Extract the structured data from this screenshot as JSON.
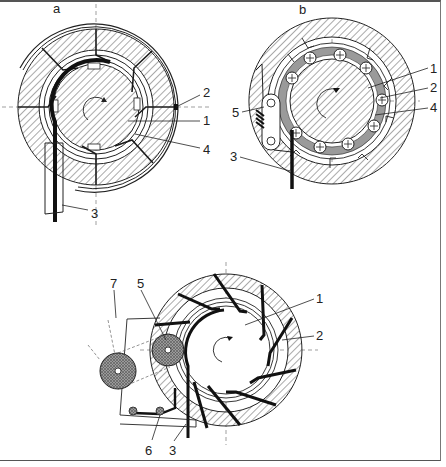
{
  "figure": {
    "type": "technical-cross-section-diagram",
    "panels": [
      {
        "id": "a",
        "label": "a",
        "callouts": [
          {
            "number": "1",
            "target": "central rotating hub"
          },
          {
            "number": "2",
            "target": "radial element in outer ring"
          },
          {
            "number": "3",
            "target": "outgoing strip / band"
          },
          {
            "number": "4",
            "target": "inner ring segment"
          }
        ]
      },
      {
        "id": "b",
        "label": "b",
        "callouts": [
          {
            "number": "1",
            "target": "central rotating hub"
          },
          {
            "number": "2",
            "target": "roller chain link"
          },
          {
            "number": "3",
            "target": "outgoing strip / band"
          },
          {
            "number": "4",
            "target": "chain pivot element"
          },
          {
            "number": "5",
            "target": "tensioning lever with spring"
          }
        ]
      },
      {
        "id": "c",
        "label": "",
        "callouts": [
          {
            "number": "1",
            "target": "central rotating disk"
          },
          {
            "number": "2",
            "target": "curved vane"
          },
          {
            "number": "3",
            "target": "outgoing strip / band"
          },
          {
            "number": "5",
            "target": "guide roller"
          },
          {
            "number": "6",
            "target": "bracket bolt"
          },
          {
            "number": "7",
            "target": "drive roller"
          }
        ]
      }
    ],
    "labels": {
      "a_title": "a",
      "b_title": "b",
      "a1": "1",
      "a2": "2",
      "a3": "3",
      "a4": "4",
      "b1": "1",
      "b2": "2",
      "b3": "3",
      "b4": "4",
      "b5": "5",
      "c1": "1",
      "c2": "2",
      "c3": "3",
      "c5": "5",
      "c6": "6",
      "c7": "7"
    },
    "colors": {
      "line": "#1a1a1a",
      "hatch": "#555555",
      "roller_fill": "#8a8a8a",
      "chain_fill": "#9a9a9a",
      "background": "#ffffff"
    }
  }
}
